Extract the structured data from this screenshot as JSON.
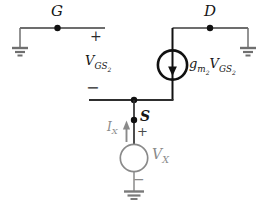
{
  "diagram": {
    "type": "circuit-schematic"
  },
  "labels": {
    "gate": "G",
    "drain": "D",
    "source": "S",
    "vgs_plus": "+",
    "vgs_minus": "−",
    "vgs": {
      "base": "V",
      "sub": "GS",
      "subsub": "2"
    },
    "gm_vgs": {
      "coeff_base": "g",
      "coeff_sub": "m",
      "coeff_subsub": "2",
      "var_base": "V",
      "var_sub": "GS",
      "var_subsub": "2"
    },
    "ix": {
      "base": "I",
      "sub": "X"
    },
    "vx": {
      "base": "V",
      "sub": "X"
    },
    "vx_plus": "+",
    "vx_minus": "−"
  },
  "icons": {
    "ground": "ground-icon",
    "dependent_current_source": "current-source-down-arrow-icon",
    "test_voltage_source": "voltage-source-circle-icon",
    "current_direction": "arrow-up-icon",
    "node_dot": "connection-dot"
  },
  "colors": {
    "background": "#ffffff",
    "wire_dark": "#3c3c3c",
    "branch_black": "#111111",
    "gray_element": "#8a8a8a",
    "ground_gray": "#6f6f6f",
    "text_black": "#161616"
  }
}
